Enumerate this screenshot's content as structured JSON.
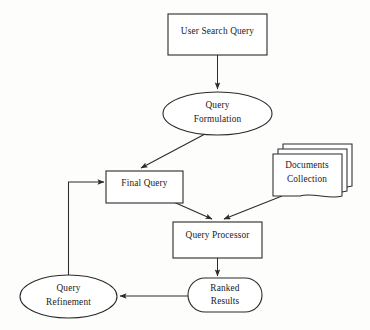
{
  "diagram": {
    "background_color": "#fdfdfb",
    "line_color": "#2b2b2b",
    "shape_fill": "#ffffff",
    "nodes": {
      "user_search_query": {
        "label": "User Search Query",
        "shape": "rectangle"
      },
      "query_formulation": {
        "label_line1": "Query",
        "label_line2": "Formulation",
        "shape": "ellipse"
      },
      "final_query": {
        "label": "Final Query",
        "shape": "rectangle"
      },
      "documents_collection": {
        "label_line1": "Documents",
        "label_line2": "Collection",
        "shape": "document-stack"
      },
      "query_processor": {
        "label": "Query Processor",
        "shape": "rectangle"
      },
      "ranked_results": {
        "label_line1": "Ranked",
        "label_line2": "Results",
        "shape": "stadium"
      },
      "query_refinement": {
        "label_line1": "Query",
        "label_line2": "Refinement",
        "shape": "ellipse"
      }
    },
    "edges": [
      {
        "name": "user-search-query-to-query-formulation",
        "from": "user_search_query",
        "to": "query_formulation",
        "style": "straight-arrow"
      },
      {
        "name": "query-formulation-to-final-query",
        "from": "query_formulation",
        "to": "final_query",
        "style": "diagonal-arrow"
      },
      {
        "name": "final-query-to-query-processor",
        "from": "final_query",
        "to": "query_processor",
        "style": "diagonal-arrow"
      },
      {
        "name": "documents-collection-to-query-processor",
        "from": "documents_collection",
        "to": "query_processor",
        "style": "diagonal-arrow"
      },
      {
        "name": "query-processor-to-ranked-results",
        "from": "query_processor",
        "to": "ranked_results",
        "style": "straight-arrow"
      },
      {
        "name": "ranked-results-to-query-refinement",
        "from": "ranked_results",
        "to": "query_refinement",
        "style": "straight-arrow"
      },
      {
        "name": "query-refinement-to-final-query",
        "from": "query_refinement",
        "to": "final_query",
        "style": "elbow-feedback-arrow"
      }
    ]
  }
}
